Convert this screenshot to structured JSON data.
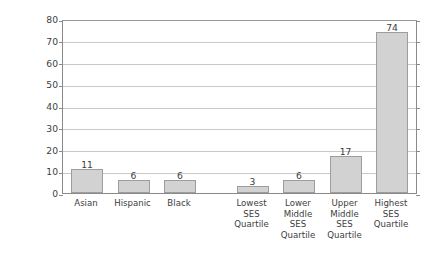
{
  "chart_data": {
    "type": "bar",
    "title": "",
    "xlabel": "",
    "ylabel_line1": "Freshmen Enrolled at",
    "ylabel_line2": "Highly Selective Universities (%)",
    "ylim": [
      0,
      80
    ],
    "ytick_step": 10,
    "yticks": [
      "0",
      "10",
      "20",
      "30",
      "40",
      "50",
      "60",
      "70",
      "80"
    ],
    "grid": true,
    "legend": "none",
    "bar_color": "#d2d2d2",
    "bar_border_color": "#9d9d9d",
    "grid_color": "#c9c9c9",
    "axis_color": "#8a8a8a",
    "groups": [
      {
        "name": "race-ethnicity",
        "categories": [
          "Asian",
          "Hispanic",
          "Black"
        ],
        "values": [
          11,
          6,
          6
        ]
      },
      {
        "name": "ses-quartile",
        "categories": [
          "Lowest\nSES\nQuartile",
          "Lower\nMiddle\nSES\nQuartile",
          "Upper\nMiddle\nSES\nQuartile",
          "Highest\nSES\nQuartile"
        ],
        "values": [
          3,
          6,
          17,
          74
        ]
      }
    ],
    "categories": [
      "Asian",
      "Hispanic",
      "Black",
      "Lowest\nSES\nQuartile",
      "Lower\nMiddle\nSES\nQuartile",
      "Upper\nMiddle\nSES\nQuartile",
      "Highest\nSES\nQuartile"
    ],
    "values": [
      11,
      6,
      6,
      3,
      6,
      17,
      74
    ],
    "value_labels": [
      "11",
      "6",
      "6",
      "3",
      "6",
      "17",
      "74"
    ]
  }
}
